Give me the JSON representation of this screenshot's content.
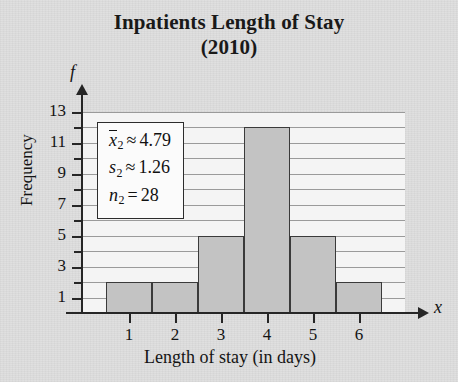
{
  "title": {
    "line1": "Inpatients Length of Stay",
    "line2": "(2010)"
  },
  "axes": {
    "y_variable": "f",
    "x_variable": "x",
    "y_title": "Frequency",
    "x_title": "Length of stay (in days)"
  },
  "stats_box": {
    "mean_symbol": "x",
    "mean_subscript": "2",
    "mean_operator": "≈",
    "mean_value": "4.79",
    "sd_symbol": "s",
    "sd_subscript": "2",
    "sd_operator": "≈",
    "sd_value": "1.26",
    "n_symbol": "n",
    "n_subscript": "2",
    "n_operator": "=",
    "n_value": "28"
  },
  "colors": {
    "bar_fill": "#c3c3c3",
    "bar_border": "#3a3a3a",
    "axis": "#262626",
    "gridline": "#9a9a9a",
    "page_background": "#dedede",
    "plot_background": "#f4f4f4"
  },
  "chart_data": {
    "type": "bar",
    "title": "Inpatients Length of Stay (2010)",
    "xlabel": "Length of stay (in days)",
    "ylabel": "Frequency",
    "categories": [
      "1",
      "2",
      "3",
      "4",
      "5",
      "6"
    ],
    "values": [
      2,
      2,
      5,
      12,
      5,
      2
    ],
    "ylim": [
      0,
      13
    ],
    "xlim": [
      0.5,
      6.5
    ],
    "y_ticks_labeled": [
      1,
      3,
      5,
      7,
      9,
      11,
      13
    ],
    "y_ticks_all": [
      1,
      2,
      3,
      4,
      5,
      6,
      7,
      8,
      9,
      10,
      11,
      12,
      13
    ],
    "x_ticks": [
      1,
      2,
      3,
      4,
      5,
      6
    ],
    "grid": true,
    "grid_axis": "y",
    "legend": "none",
    "annotations": [
      "x̅2 ≈ 4.79",
      "s2 ≈ 1.26",
      "n2 = 28"
    ],
    "total_frequency": 28
  }
}
